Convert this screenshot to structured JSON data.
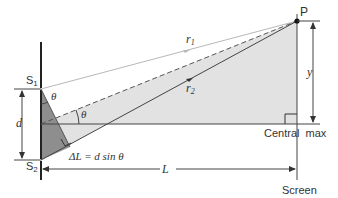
{
  "diagram": {
    "labels": {
      "P": "P",
      "r1": "r",
      "r1_sub": "1",
      "r2": "r",
      "r2_sub": "2",
      "y": "y",
      "S1": "S",
      "S1_sub": "1",
      "S2": "S",
      "S2_sub": "2",
      "d": "d",
      "theta_top": "θ",
      "theta_mid": "θ",
      "path_diff": "ΔL = d sin θ",
      "L": "L",
      "central_max": "Central  max",
      "screen": "Screen"
    },
    "colors": {
      "line": "#3a3a3a",
      "light_fill": "#e2e2e2",
      "dark_fill": "#8e8e8e",
      "faint_line": "#b8b8b8",
      "text": "#333333"
    }
  }
}
